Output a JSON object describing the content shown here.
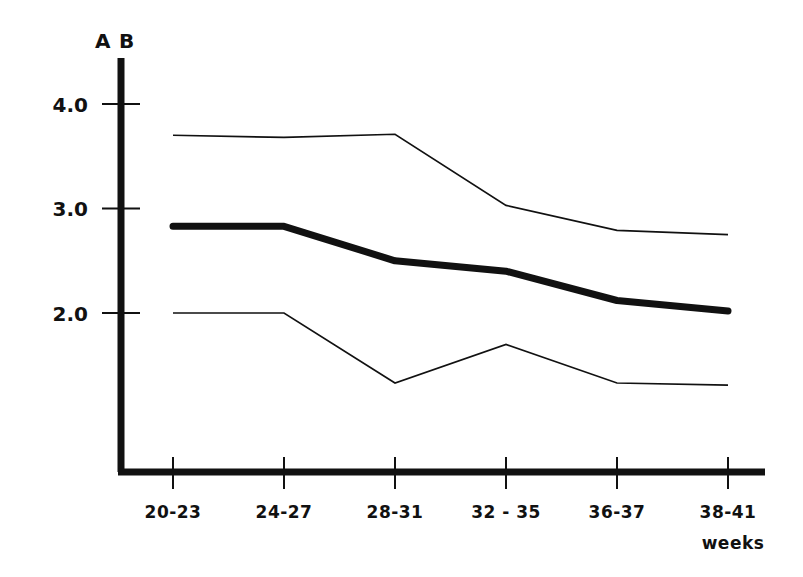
{
  "chart_data": {
    "type": "line",
    "title": "",
    "subtitle": "",
    "xlabel": "weeks",
    "ylabel": "",
    "group_label_left": "A",
    "group_label_right": "B",
    "categories": [
      "20-23",
      "24-27",
      "28-31",
      "32 - 35",
      "36-37",
      "38-41"
    ],
    "x_unit": "weeks",
    "y_ticks": [
      "4.0",
      "3.0",
      "2.0"
    ],
    "y_tick_values": [
      4.0,
      3.0,
      2.0
    ],
    "ylim": [
      0.0,
      4.4
    ],
    "xlim": [
      0,
      6
    ],
    "grid": false,
    "legend": "none",
    "series": [
      {
        "name": "upper",
        "style": "thin",
        "values": [
          3.7,
          3.68,
          3.71,
          3.03,
          2.79,
          2.75
        ]
      },
      {
        "name": "median",
        "style": "thick",
        "values": [
          2.83,
          2.83,
          2.5,
          2.4,
          2.12,
          2.02
        ]
      },
      {
        "name": "lower",
        "style": "thin",
        "values": [
          2.0,
          2.0,
          1.33,
          1.7,
          1.33,
          1.31
        ]
      }
    ]
  },
  "axes": {
    "y_axis_name": "vertical-axis",
    "x_axis_name": "horizontal-axis"
  }
}
